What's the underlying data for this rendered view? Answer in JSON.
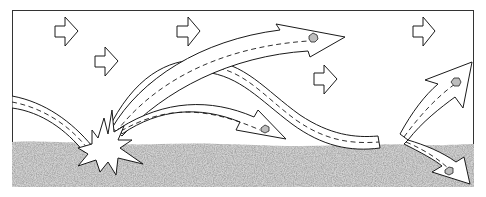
{
  "diagram": {
    "colors": {
      "background": "#ffffff",
      "frame": "#333333",
      "ink": "#1a1a1a",
      "ground": "#c4c4c4",
      "grain": "#bdbdbd"
    },
    "frame": {
      "x": 12,
      "y": 10,
      "width": 462,
      "height": 177
    },
    "wind_arrows": [
      {
        "x": 55,
        "y": 16
      },
      {
        "x": 95,
        "y": 46
      },
      {
        "x": 177,
        "y": 16
      },
      {
        "x": 314,
        "y": 65
      },
      {
        "x": 413,
        "y": 16
      }
    ],
    "impact_bursts": [
      {
        "x": 105,
        "y": 150,
        "label": "impact-left"
      },
      {
        "x": 393,
        "y": 143,
        "label": "impact-right"
      }
    ],
    "trajectories": [
      {
        "name": "incoming-left",
        "from": "left-edge",
        "to": "impact-left"
      },
      {
        "name": "high-hop",
        "from": "impact-left",
        "to": "upper-middle",
        "grain": true
      },
      {
        "name": "long-hop",
        "from": "impact-left",
        "to": "impact-right"
      },
      {
        "name": "short-hop",
        "from": "impact-left",
        "to": "middle",
        "grain": true
      },
      {
        "name": "rebound-up",
        "from": "impact-right",
        "to": "upper-right",
        "grain": true
      },
      {
        "name": "rebound-down",
        "from": "impact-right",
        "to": "lower-right",
        "grain": true
      }
    ],
    "ground_surface_y": 143
  }
}
